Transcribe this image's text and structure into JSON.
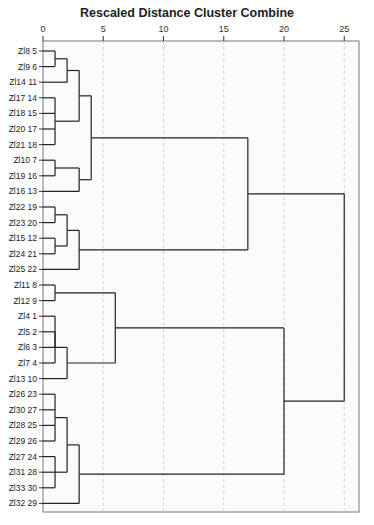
{
  "chart_data": {
    "type": "dendrogram",
    "title": "Rescaled Distance Cluster Combine",
    "xlabel": "",
    "ylabel": "",
    "xlim": [
      0,
      26.3
    ],
    "xticks": [
      0,
      5,
      10,
      15,
      20,
      25
    ],
    "grid": "vertical dashed at ticks",
    "orientation": "horizontal, leaves on left",
    "leaves": [
      {
        "label": "Zl8",
        "id": 5
      },
      {
        "label": "Zl9",
        "id": 6
      },
      {
        "label": "Zl14",
        "id": 11
      },
      {
        "label": "Zl17",
        "id": 14
      },
      {
        "label": "Zl18",
        "id": 15
      },
      {
        "label": "Zl20",
        "id": 17
      },
      {
        "label": "Zl21",
        "id": 18
      },
      {
        "label": "Zl10",
        "id": 7
      },
      {
        "label": "Zl19",
        "id": 16
      },
      {
        "label": "Zl16",
        "id": 13
      },
      {
        "label": "Zl22",
        "id": 19
      },
      {
        "label": "Zl23",
        "id": 20
      },
      {
        "label": "Zl15",
        "id": 12
      },
      {
        "label": "Zl24",
        "id": 21
      },
      {
        "label": "Zl25",
        "id": 22
      },
      {
        "label": "Zl11",
        "id": 8
      },
      {
        "label": "Zl12",
        "id": 9
      },
      {
        "label": "Zl4",
        "id": 1
      },
      {
        "label": "Zl5",
        "id": 2
      },
      {
        "label": "Zl6",
        "id": 3
      },
      {
        "label": "Zl7",
        "id": 4
      },
      {
        "label": "Zl13",
        "id": 10
      },
      {
        "label": "Zl26",
        "id": 23
      },
      {
        "label": "Zl30",
        "id": 27
      },
      {
        "label": "Zl28",
        "id": 25
      },
      {
        "label": "Zl29",
        "id": 26
      },
      {
        "label": "Zl27",
        "id": 24
      },
      {
        "label": "Zl31",
        "id": 28
      },
      {
        "label": "Zl33",
        "id": 30
      },
      {
        "label": "Zl32",
        "id": 29
      }
    ],
    "merges": [
      {
        "name": "A",
        "children": [
          "L0",
          "L1"
        ],
        "distance": 1
      },
      {
        "name": "B",
        "children": [
          "A",
          "L2"
        ],
        "distance": 2
      },
      {
        "name": "C",
        "children": [
          "L3",
          "L4",
          "L5",
          "L6"
        ],
        "distance": 1
      },
      {
        "name": "D",
        "children": [
          "B",
          "C"
        ],
        "distance": 3
      },
      {
        "name": "E",
        "children": [
          "L7",
          "L8"
        ],
        "distance": 1
      },
      {
        "name": "F",
        "children": [
          "E",
          "L9"
        ],
        "distance": 3
      },
      {
        "name": "G",
        "children": [
          "D",
          "F"
        ],
        "distance": 4
      },
      {
        "name": "H",
        "children": [
          "L10",
          "L11"
        ],
        "distance": 1
      },
      {
        "name": "I",
        "children": [
          "L12",
          "L13"
        ],
        "distance": 1
      },
      {
        "name": "J",
        "children": [
          "H",
          "I"
        ],
        "distance": 2
      },
      {
        "name": "K",
        "children": [
          "J",
          "L14"
        ],
        "distance": 3
      },
      {
        "name": "M",
        "children": [
          "G",
          "K"
        ],
        "distance": 17
      },
      {
        "name": "N",
        "children": [
          "L15",
          "L16"
        ],
        "distance": 1
      },
      {
        "name": "O",
        "children": [
          "L17",
          "L18",
          "L19"
        ],
        "distance": 1
      },
      {
        "name": "P",
        "children": [
          "L19",
          "L20"
        ],
        "distance": 1
      },
      {
        "name": "Q",
        "children": [
          "O",
          "L20"
        ],
        "distance": 1
      },
      {
        "name": "R",
        "children": [
          "Q",
          "L21"
        ],
        "distance": 2
      },
      {
        "name": "S",
        "children": [
          "N",
          "R"
        ],
        "distance": 6
      },
      {
        "name": "T",
        "children": [
          "L22",
          "L23",
          "L24",
          "L25"
        ],
        "distance": 1
      },
      {
        "name": "U",
        "children": [
          "L26",
          "L27",
          "L28"
        ],
        "distance": 1
      },
      {
        "name": "V",
        "children": [
          "T",
          "U"
        ],
        "distance": 2
      },
      {
        "name": "W",
        "children": [
          "V",
          "L29"
        ],
        "distance": 3
      },
      {
        "name": "X",
        "children": [
          "S",
          "W"
        ],
        "distance": 20
      },
      {
        "name": "Y",
        "children": [
          "M",
          "X"
        ],
        "distance": 25
      }
    ]
  },
  "layout": {
    "plot_left": 43,
    "plot_right": 359,
    "plot_top": 41,
    "plot_bottom": 512,
    "px_per_unit": 12.05,
    "first_row_y": 51,
    "row_step": 15.6
  }
}
